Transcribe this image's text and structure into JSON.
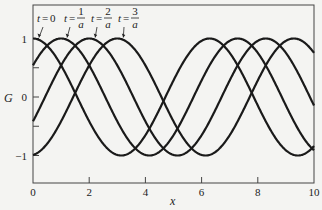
{
  "chart_data": {
    "type": "line",
    "title": "",
    "xlabel": "x",
    "ylabel": "G",
    "xlim": [
      0,
      10
    ],
    "ylim": [
      -1.5,
      1.5
    ],
    "xticks": [
      0,
      2,
      4,
      6,
      8,
      10
    ],
    "xtick_labels": [
      "0",
      "2",
      "4",
      "6",
      "8",
      "10"
    ],
    "yticks": [
      -1,
      -0.5,
      0,
      0.5,
      1
    ],
    "ytick_labels": [
      "−1",
      "",
      "0",
      "",
      "1"
    ],
    "grid": false,
    "legend": "none",
    "function": "G = cos(x - a t)",
    "series": [
      {
        "name": "t=0",
        "shift": 0,
        "label_var": "t",
        "label_num": "0",
        "label_den": ""
      },
      {
        "name": "t=1/a",
        "shift": 1,
        "label_var": "t",
        "label_num": "1",
        "label_den": "a"
      },
      {
        "name": "t=2/a",
        "shift": 2,
        "label_var": "t",
        "label_num": "2",
        "label_den": "a"
      },
      {
        "name": "t=3/a",
        "shift": 3,
        "label_var": "t",
        "label_num": "3",
        "label_den": "a"
      }
    ],
    "line_color": "#1a1a1a"
  }
}
